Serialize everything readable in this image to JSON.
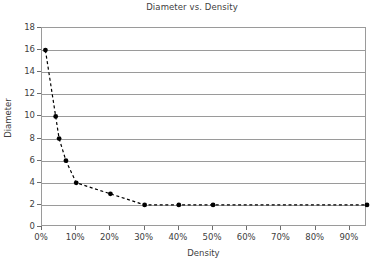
{
  "chart_data": {
    "type": "line",
    "title": "Diameter vs. Density",
    "xlabel": "Density",
    "ylabel": "Diameter",
    "x": [
      1,
      4,
      5,
      7,
      10,
      20,
      30,
      40,
      50,
      95
    ],
    "values": [
      16,
      10,
      8,
      6,
      4,
      3,
      2,
      2,
      2,
      2
    ],
    "points": [
      {
        "x": 1,
        "y": 16
      },
      {
        "x": 4,
        "y": 10
      },
      {
        "x": 5,
        "y": 8
      },
      {
        "x": 7,
        "y": 6
      },
      {
        "x": 10,
        "y": 4
      },
      {
        "x": 20,
        "y": 3
      },
      {
        "x": 30,
        "y": 2
      },
      {
        "x": 40,
        "y": 2
      },
      {
        "x": 50,
        "y": 2
      },
      {
        "x": 95,
        "y": 2
      }
    ],
    "xlim": [
      0,
      95
    ],
    "ylim": [
      0,
      18
    ],
    "x_ticks": [
      0,
      10,
      20,
      30,
      40,
      50,
      60,
      70,
      80,
      90
    ],
    "x_tick_labels": [
      "0%",
      "10%",
      "20%",
      "30%",
      "40%",
      "50%",
      "60%",
      "70%",
      "80%",
      "90%"
    ],
    "y_ticks": [
      0,
      2,
      4,
      6,
      8,
      10,
      12,
      14,
      16,
      18
    ],
    "y_tick_labels": [
      "0",
      "2",
      "4",
      "6",
      "8",
      "10",
      "12",
      "14",
      "16",
      "18"
    ],
    "grid": "horizontal",
    "legend": "none",
    "line_style": "dashed",
    "marker": "filled-circle",
    "series_color": "#000000",
    "grid_color": "#9a9a9a",
    "axis_color": "#9a9a9a",
    "text_color": "#404040",
    "background": "#ffffff"
  },
  "footer": {
    "bleed_text": ""
  }
}
